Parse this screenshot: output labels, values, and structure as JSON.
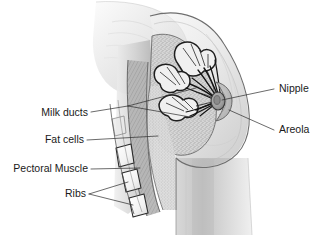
{
  "figure": {
    "type": "medical-illustration",
    "style": "grayscale pencil drawing",
    "background_color": "#ffffff",
    "line_color": "#2b2b2b",
    "text_color": "#1a1a1a"
  },
  "labels": {
    "milk_ducts": "Milk ducts",
    "fat_cells": "Fat cells",
    "pectoral_muscle": "Pectoral Muscle",
    "ribs": "Ribs",
    "nipple": "Nipple",
    "areola": "Areola"
  },
  "anatomy": {
    "rib_count": 3,
    "duct_lobule_count": 3,
    "structures": [
      "skin",
      "subcutaneous fat",
      "glandular tissue",
      "milk ducts",
      "lactiferous sinus",
      "nipple",
      "areola",
      "pectoral muscle",
      "ribs",
      "upper arm"
    ]
  }
}
